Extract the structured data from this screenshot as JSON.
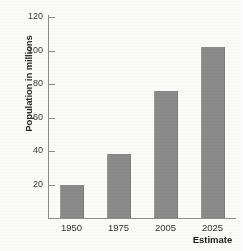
{
  "chart_data": {
    "type": "bar",
    "title": "",
    "subtitle": "",
    "xlabel": "",
    "ylabel": "Population in millions",
    "categories": [
      "1950",
      "1975",
      "2005",
      "2025"
    ],
    "values": [
      20,
      38,
      76,
      102
    ],
    "series": [
      {
        "name": "Population in millions",
        "values": [
          20,
          38,
          76,
          102
        ]
      }
    ],
    "ylim": [
      0,
      120
    ],
    "yticks": [
      20,
      40,
      60,
      80,
      100,
      120
    ],
    "ytick_labels": [
      "20",
      "40",
      "60",
      "80",
      "100",
      "120"
    ],
    "grid": false,
    "legend": false,
    "legend_position": "none",
    "annotations": [
      {
        "text": "Estimate",
        "attached_to_category": "2025",
        "position": "below-axis"
      }
    ],
    "bar_color": "#8a8a8a",
    "axis_color": "#8c8c8c",
    "background_color": "#fbfbfa",
    "text_color": "#2b2b2b"
  }
}
